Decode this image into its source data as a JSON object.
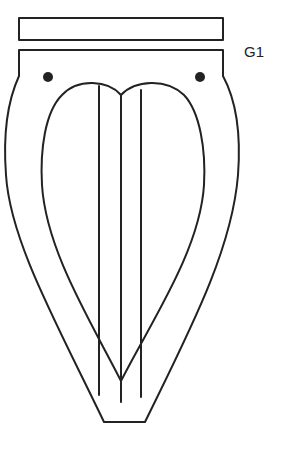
{
  "figure": {
    "label": "G1",
    "stroke_color": "#222222",
    "background": "#ffffff"
  },
  "parts": {
    "top_bar": "rectangular bar",
    "body": "outer tapered body",
    "holes": [
      "left hole",
      "right hole"
    ],
    "heart": "heart-shaped inner outline",
    "vertical_lines": [
      "left line",
      "center line",
      "right line"
    ]
  }
}
